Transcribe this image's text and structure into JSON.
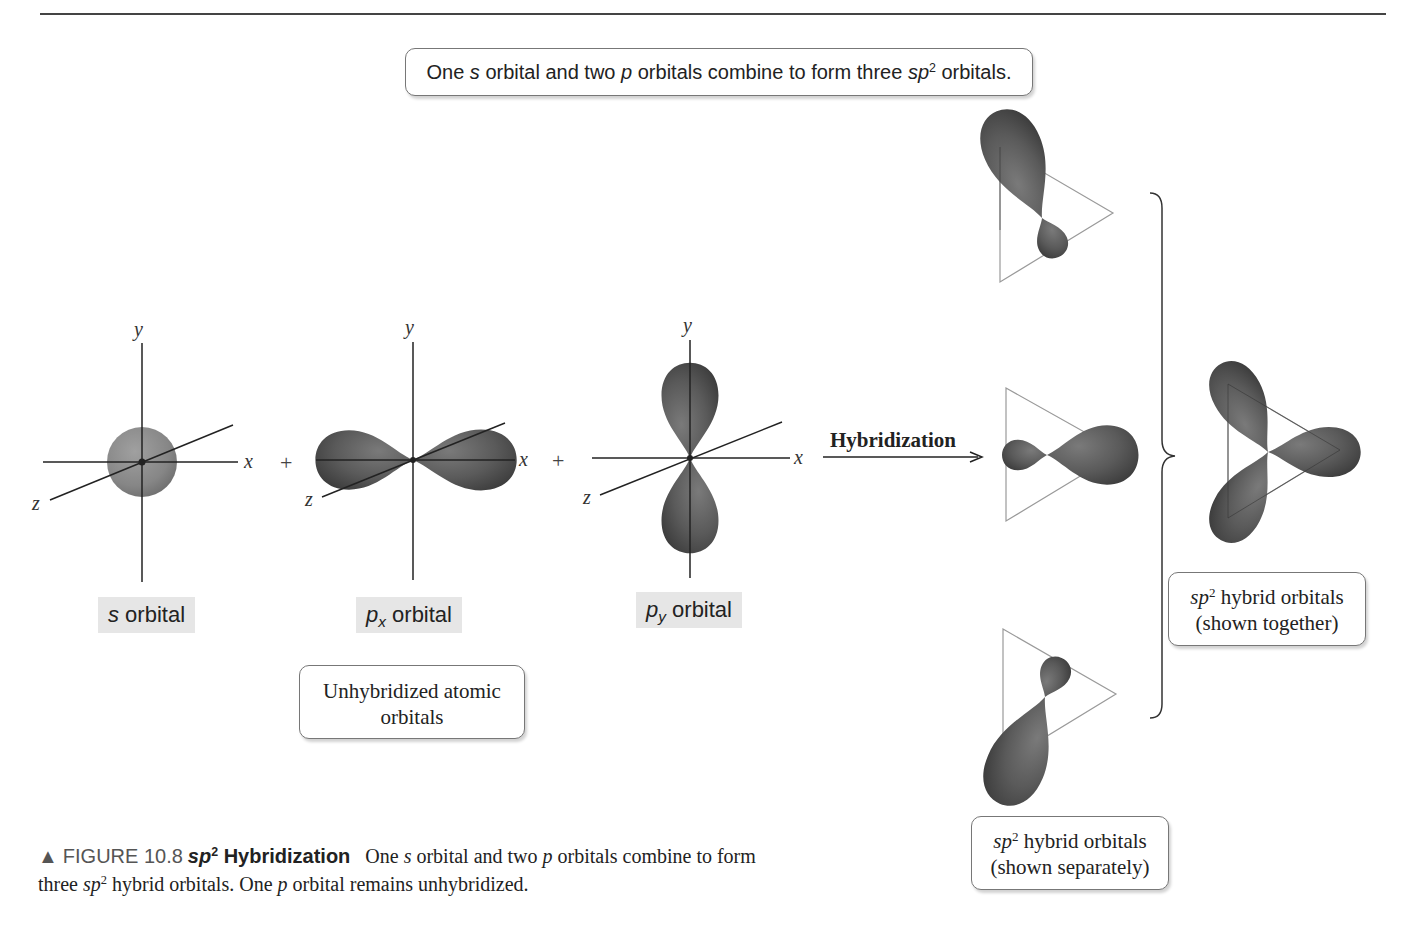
{
  "header": {
    "statement_parts": [
      "One ",
      "s",
      " orbital and two ",
      "p",
      " orbitals combine to form three ",
      "sp",
      "2",
      " orbitals."
    ]
  },
  "atomic_orbitals": [
    {
      "id": "s",
      "label_main": "s",
      "label_sub": "",
      "label_rest": " orbital",
      "axes": {
        "x": "x",
        "y": "y",
        "z": "z"
      },
      "shape": "sphere"
    },
    {
      "id": "px",
      "label_main": "p",
      "label_sub": "x",
      "label_rest": " orbital",
      "axes": {
        "x": "x",
        "y": "y",
        "z": "z"
      },
      "shape": "dumbbell-horizontal"
    },
    {
      "id": "py",
      "label_main": "p",
      "label_sub": "y",
      "label_rest": " orbital",
      "axes": {
        "x": "x",
        "y": "y",
        "z": "z"
      },
      "shape": "dumbbell-vertical"
    }
  ],
  "operators": {
    "plus1": "+",
    "plus2": "+"
  },
  "unhybridized_box": {
    "line1": "Unhybridized atomic",
    "line2": "orbitals"
  },
  "process": {
    "label": "Hybridization",
    "arrow": "right-arrow"
  },
  "hybrid_separate_box": {
    "sp": "sp",
    "sup": "2",
    "line1_rest": " hybrid orbitals",
    "line2": "(shown separately)"
  },
  "hybrid_together_box": {
    "sp": "sp",
    "sup": "2",
    "line1_rest": " hybrid orbitals",
    "line2": "(shown together)"
  },
  "caption": {
    "marker": "▲",
    "figure_number": "FIGURE 10.8",
    "title_sp": "sp",
    "title_sup": "2",
    "title_rest": " Hybridization",
    "text_parts": [
      "One ",
      "s",
      " orbital and two ",
      "p",
      " orbitals combine to form three ",
      "sp",
      "2",
      " hybrid orbitals. One ",
      "p",
      " orbital remains unhybridized."
    ]
  },
  "colors": {
    "orbital_fill": "#5a5a5a",
    "s_orbital_fill": "#8a8a8a",
    "axis_line": "#222222",
    "triangle_line": "#9a9a9a",
    "label_bg": "#e6e6e6",
    "box_border": "#777777"
  }
}
